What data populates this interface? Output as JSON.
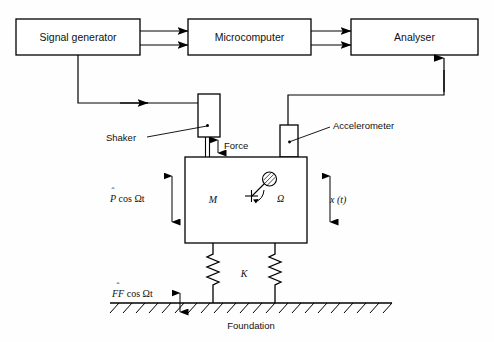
{
  "diagram": {
    "instrument_boxes": [
      {
        "id": "signal-generator",
        "label": "Signal generator"
      },
      {
        "id": "microcomputer",
        "label": "Microcomputer"
      },
      {
        "id": "analyser",
        "label": "Analyser"
      }
    ],
    "component_labels": {
      "shaker": "Shaker",
      "accelerometer": "Accelerometer",
      "force": "Force",
      "foundation": "Foundation"
    },
    "mass_labels": {
      "mass": "M",
      "stiffness": "K",
      "rotation_rate": "Ω",
      "excitation_force": {
        "hat": "ˆ",
        "base": "P",
        "rest": " cos Ωt"
      },
      "displacement": "x (t)",
      "transmitted_force": {
        "hat": "ˆ",
        "base": "FF",
        "rest": " cos Ωt"
      }
    },
    "signal_flow": [
      {
        "from": "signal-generator",
        "to": "microcomputer",
        "direction": "right"
      },
      {
        "from": "microcomputer",
        "to": "signal-generator",
        "direction": "left"
      },
      {
        "from": "microcomputer",
        "to": "analyser",
        "direction": "right"
      },
      {
        "from": "analyser",
        "to": "microcomputer",
        "direction": "left"
      },
      {
        "from": "signal-generator",
        "to": "shaker",
        "direction": "right"
      },
      {
        "from": "accelerometer",
        "to": "analyser",
        "direction": "up"
      }
    ],
    "colors": {
      "line": "#000000",
      "background": "#ffffff",
      "text": "#111111"
    }
  }
}
